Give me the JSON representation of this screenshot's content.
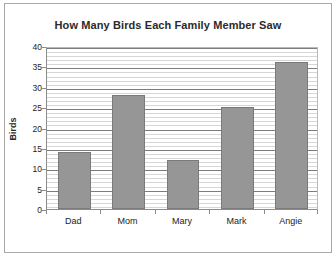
{
  "chart_data": {
    "type": "bar",
    "title": "How Many Birds Each Family Member Saw",
    "xlabel": "",
    "ylabel": "Birds",
    "categories": [
      "Dad",
      "Mom",
      "Mary",
      "Mark",
      "Angie"
    ],
    "values": [
      14,
      28,
      12,
      25,
      36
    ],
    "ylim": [
      0,
      40
    ],
    "y_ticks": [
      0,
      5,
      10,
      15,
      20,
      25,
      30,
      35,
      40
    ],
    "y_tick_labels": [
      "0",
      "5",
      "10",
      "15",
      "20",
      "25",
      "30",
      "35",
      "40"
    ],
    "y_minor_tick_step": 1,
    "grid": true,
    "grid_axis": "y",
    "legend": false,
    "legend_position": "none",
    "bar_color": "#969696",
    "bar_edge_color": "#7a7a7a",
    "plot_background": "#ffffff",
    "major_gridline_color": "#7c7c7c",
    "minor_gridline_color": "#d6d6d6",
    "axis_color": "#8c8c8c",
    "text_color": "#242424",
    "title_color": "#2b2b2b"
  }
}
